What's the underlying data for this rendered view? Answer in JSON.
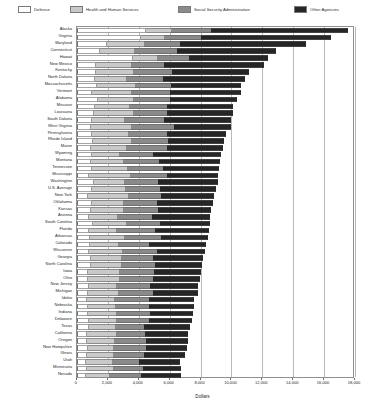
{
  "chart_data": {
    "type": "bar",
    "orientation": "horizontal",
    "stacked": true,
    "title": "",
    "xlabel": "Dollars",
    "ylabel": "",
    "xlim": [
      0,
      18000
    ],
    "grid": true,
    "legend_position": "top",
    "xticks": [
      "0",
      "2,000",
      "4,000",
      "6,000",
      "8,000",
      "10,000",
      "12,000",
      "14,000",
      "16,000",
      "18,000"
    ],
    "xtick_values": [
      0,
      2000,
      4000,
      6000,
      8000,
      10000,
      12000,
      14000,
      16000,
      18000
    ],
    "series": [
      {
        "name": "Defense",
        "color": "#ffffff"
      },
      {
        "name": "Health and Human Services",
        "color": "#c9c9c9"
      },
      {
        "name": "Social Security Administration",
        "color": "#8a8a8a"
      },
      {
        "name": "Other Agencies",
        "color": "#262626"
      }
    ],
    "categories": [
      "Alaska",
      "Virginia",
      "Maryland",
      "Connecticut",
      "Hawaii",
      "New Mexico",
      "Kentucky",
      "North Dakota",
      "Massachusetts",
      "Vermont",
      "Alabama",
      "Missouri",
      "Louisiana",
      "South Dakota",
      "West Virginia",
      "Pennsylvania",
      "Rhode Island",
      "Maine",
      "Wyoming",
      "Montana",
      "Tennessee",
      "Mississippi",
      "Washington",
      "U.S. Average",
      "New York",
      "Oklahoma",
      "Kansas",
      "Arizona",
      "South Carolina",
      "Florida",
      "Arkansas",
      "Colorado",
      "Wisconsin",
      "Georgia",
      "North Carolina",
      "Iowa",
      "Ohio",
      "New Jersey",
      "Michigan",
      "Idaho",
      "Nebraska",
      "Indiana",
      "Delaware",
      "Texas",
      "California",
      "Oregon",
      "New Hampshire",
      "Illinois",
      "Utah",
      "Minnesota",
      "Nevada"
    ],
    "values": [
      [
        4450,
        1650,
        2550,
        8900
      ],
      [
        4150,
        1500,
        2350,
        8450
      ],
      [
        1950,
        2400,
        2350,
        8150
      ],
      [
        1500,
        2200,
        2800,
        6400
      ],
      [
        3600,
        1550,
        2100,
        5150
      ],
      [
        1250,
        2250,
        2150,
        6450
      ],
      [
        1200,
        2450,
        2500,
        5000
      ],
      [
        1150,
        2000,
        2400,
        5350
      ],
      [
        1300,
        2450,
        2350,
        4550
      ],
      [
        1000,
        2500,
        2550,
        4550
      ],
      [
        1350,
        2250,
        2400,
        4350
      ],
      [
        1150,
        2200,
        2500,
        4250
      ],
      [
        1100,
        2500,
        2200,
        4300
      ],
      [
        1000,
        2050,
        2600,
        4350
      ],
      [
        900,
        2600,
        2750,
        3700
      ],
      [
        1000,
        2300,
        2550,
        3800
      ],
      [
        1050,
        2450,
        2400,
        3650
      ],
      [
        900,
        2300,
        2600,
        3650
      ],
      [
        950,
        1800,
        2200,
        4350
      ],
      [
        900,
        2050,
        2350,
        3950
      ],
      [
        950,
        2300,
        2300,
        3650
      ],
      [
        800,
        2650,
        2350,
        3350
      ],
      [
        1100,
        1950,
        2200,
        3850
      ],
      [
        1000,
        2100,
        2250,
        3650
      ],
      [
        700,
        2600,
        2150,
        3450
      ],
      [
        1000,
        2000,
        2200,
        3600
      ],
      [
        900,
        2050,
        2300,
        3450
      ],
      [
        800,
        1800,
        2250,
        3750
      ],
      [
        1050,
        2100,
        2200,
        3250
      ],
      [
        800,
        1750,
        2500,
        3500
      ],
      [
        850,
        2200,
        2400,
        3050
      ],
      [
        850,
        1800,
        2000,
        3700
      ],
      [
        750,
        2150,
        2250,
        3150
      ],
      [
        900,
        1950,
        2100,
        3200
      ],
      [
        900,
        1950,
        2200,
        3050
      ],
      [
        700,
        2000,
        2300,
        3050
      ],
      [
        700,
        2000,
        2200,
        3050
      ],
      [
        750,
        1750,
        2200,
        3150
      ],
      [
        700,
        1950,
        2300,
        2900
      ],
      [
        650,
        1750,
        2250,
        2950
      ],
      [
        700,
        1750,
        2200,
        2900
      ],
      [
        700,
        1800,
        2200,
        2800
      ],
      [
        750,
        1750,
        2150,
        2800
      ],
      [
        750,
        1700,
        1900,
        2950
      ],
      [
        650,
        1850,
        1900,
        2800
      ],
      [
        650,
        1750,
        2050,
        2750
      ],
      [
        700,
        1650,
        2100,
        2650
      ],
      [
        650,
        1700,
        2000,
        2650
      ],
      [
        600,
        1650,
        1750,
        2700
      ],
      [
        650,
        1650,
        2000,
        2450
      ],
      [
        600,
        1500,
        2050,
        2600
      ]
    ]
  }
}
